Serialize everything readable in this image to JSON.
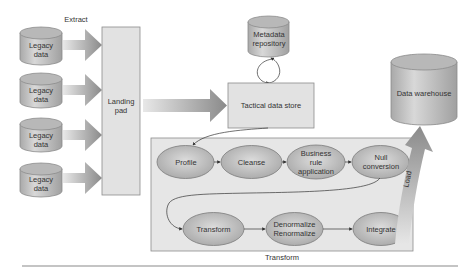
{
  "diagram": {
    "extract_label": "Extract",
    "legacy_sources": [
      {
        "label": "Legacy data"
      },
      {
        "label": "Legacy data"
      },
      {
        "label": "Legacy data"
      },
      {
        "label": "Legacy data"
      }
    ],
    "landing_pad": {
      "label": "Landing pad"
    },
    "metadata_repository": {
      "label": "Metadata repository"
    },
    "tactical_data_store": {
      "label": "Tactical data store"
    },
    "data_warehouse": {
      "label": "Data warehouse"
    },
    "load_label": "Load",
    "transform_group": {
      "label": "Transform",
      "steps": [
        {
          "label": "Profile"
        },
        {
          "label": "Cleanse"
        },
        {
          "label": "Business rule application"
        },
        {
          "label": "Null conversion"
        },
        {
          "label": "Transform"
        },
        {
          "label": "Denormalize Renormalize"
        },
        {
          "label": "Integrate"
        }
      ]
    },
    "colors": {
      "box_fill": "#e2e2e2",
      "container_fill": "#e6e6e6",
      "ellipse_fill": "#c8c8c8",
      "cylinder_fill": "#c4c4c4",
      "arrow": "#8a8a8a",
      "border": "#8c8c8c",
      "text": "#333333"
    }
  }
}
